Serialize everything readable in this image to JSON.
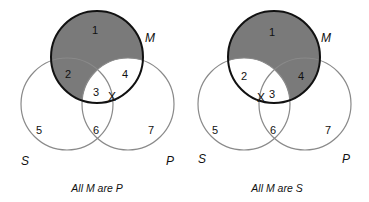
{
  "colors": {
    "shade": "#7a7a7a",
    "thin_circle": "#8a8a8a",
    "bold_circle": "#111111"
  },
  "diagrams": [
    {
      "caption": "All M are P",
      "set_labels": {
        "M": "M",
        "S": "S",
        "P": "P"
      },
      "regions": [
        "1",
        "2",
        "3",
        "4",
        "5",
        "6",
        "7"
      ],
      "shaded_regions": [
        "1",
        "2"
      ],
      "x_mark": "X",
      "x_position": "on boundary between regions 3 and 4"
    },
    {
      "caption": "All M are S",
      "set_labels": {
        "M": "M",
        "S": "S",
        "P": "P"
      },
      "regions": [
        "1",
        "2",
        "3",
        "4",
        "5",
        "6",
        "7"
      ],
      "shaded_regions": [
        "1",
        "4"
      ],
      "x_mark": "X",
      "x_position": "on boundary between regions 2 and 3"
    }
  ]
}
